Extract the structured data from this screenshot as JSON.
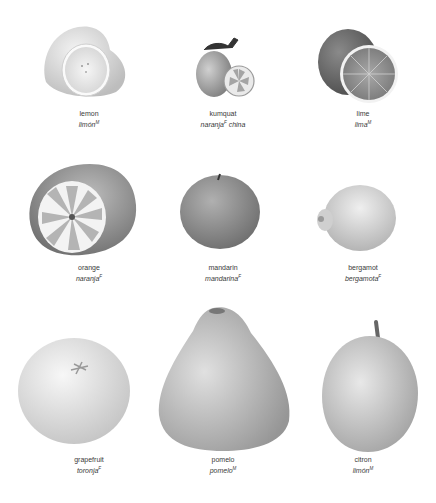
{
  "page": {
    "background": "#ffffff",
    "fruits": [
      {
        "id": "lemon",
        "name": "lemon",
        "translation": "limón",
        "gender": "M",
        "extra": ""
      },
      {
        "id": "kumquat",
        "name": "kumquat",
        "translation": "naranja",
        "gender": "F",
        "extra": "china"
      },
      {
        "id": "lime",
        "name": "lime",
        "translation": "lima",
        "gender": "M",
        "extra": ""
      },
      {
        "id": "orange",
        "name": "orange",
        "translation": "naranja",
        "gender": "F",
        "extra": ""
      },
      {
        "id": "mandarin",
        "name": "mandarin",
        "translation": "mandarina",
        "gender": "F",
        "extra": ""
      },
      {
        "id": "bergamot",
        "name": "bergamot",
        "translation": "bergamota",
        "gender": "F",
        "extra": ""
      },
      {
        "id": "grapefruit",
        "name": "grapefruit",
        "translation": "toronja",
        "gender": "F",
        "extra": ""
      },
      {
        "id": "pomelo",
        "name": "pomelo",
        "translation": "pomelo",
        "gender": "M",
        "extra": ""
      },
      {
        "id": "citron",
        "name": "citron",
        "translation": "limón",
        "gender": "M",
        "extra": ""
      }
    ]
  }
}
